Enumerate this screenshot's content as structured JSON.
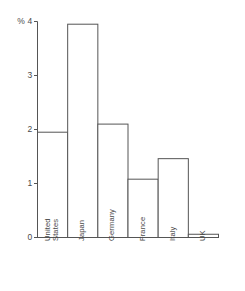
{
  "chart_data": {
    "type": "bar",
    "title": "",
    "subtitle": "",
    "xlabel": "",
    "ylabel": "%",
    "categories": [
      "United States",
      "Japan",
      "Germany",
      "France",
      "Italy",
      "UK"
    ],
    "values": [
      1.95,
      3.95,
      2.1,
      1.08,
      1.46,
      0.06
    ],
    "ylim": [
      0,
      4
    ],
    "yticks": [
      0,
      1,
      2,
      3,
      4
    ],
    "ytick_labels": [
      "0",
      "1",
      "2",
      "3",
      "% 4"
    ],
    "grid": false,
    "legend": "none",
    "bar_fill": "#ffffff",
    "bar_edge": "#555555",
    "axis_color": "#555555",
    "text_color": "#4a4a4a"
  },
  "axis": {
    "y_tick_0": "0",
    "y_tick_1": "1",
    "y_tick_2": "2",
    "y_tick_3": "3",
    "y_tick_4": "% 4"
  },
  "categories_display": {
    "united_states_line1": "United",
    "united_states_line2": "States",
    "japan": "Japan",
    "germany": "Germany",
    "france": "France",
    "uk": "UK",
    "italy": "Italy"
  }
}
